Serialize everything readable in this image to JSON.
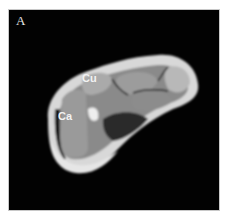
{
  "figure": {
    "panel_label": "A",
    "labels": [
      {
        "id": "cu",
        "text": "Cu"
      },
      {
        "id": "ca",
        "text": "Ca"
      }
    ],
    "background_color": "#020202"
  }
}
